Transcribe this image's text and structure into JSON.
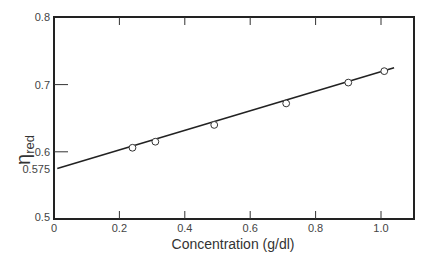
{
  "chart_data": {
    "type": "scatter",
    "title": "",
    "xlabel": "Concentration (g/dl)",
    "ylabel": "η",
    "ylabel_subscript": "red",
    "xlim": [
      0,
      1.1
    ],
    "ylim": [
      0.5,
      0.8
    ],
    "x_ticks": [
      "0",
      "0.2",
      "0.4",
      "0.6",
      "0.8",
      "1.0"
    ],
    "y_ticks": [
      "0.5",
      "0.575",
      "0.6",
      "0.7",
      "0.8"
    ],
    "grid": false,
    "legend": null,
    "series": [
      {
        "name": "measured",
        "marker": "open-circle",
        "x": [
          0.24,
          0.31,
          0.49,
          0.71,
          0.9,
          1.01
        ],
        "y": [
          0.606,
          0.615,
          0.64,
          0.672,
          0.703,
          0.72
        ]
      },
      {
        "name": "linear fit",
        "style": "line",
        "x": [
          0.01,
          1.04
        ],
        "y": [
          0.575,
          0.725
        ]
      }
    ],
    "annotations": [
      "y-intercept 0.575"
    ]
  }
}
